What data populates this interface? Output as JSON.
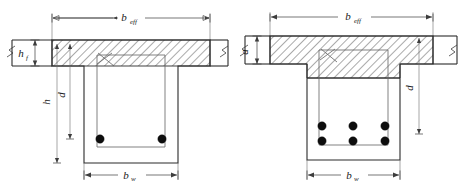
{
  "figure": {
    "background_color": "#ffffff",
    "line_color": "#2b2b2b",
    "rebar_color": "#0d0d0d",
    "hatch_color": "#2b2b2b"
  },
  "diagrams": [
    {
      "id": "left",
      "caption": "T-beam with neutral axis within the flange",
      "hatch_region": "flange",
      "rebar_rows": 1,
      "rebar_per_row": 2,
      "rebar_total": 2,
      "labels": {
        "b_eff": {
          "base": "b",
          "sub": "eff"
        },
        "b_w": {
          "base": "b",
          "sub": "w"
        },
        "h_f": {
          "base": "h",
          "sub": "f"
        },
        "h": {
          "base": "h",
          "sub": ""
        },
        "d": {
          "base": "d",
          "sub": ""
        }
      }
    },
    {
      "id": "right",
      "caption": "T-beam with compression block extending into the web",
      "hatch_region": "flange-and-web-block",
      "rebar_rows": 2,
      "rebar_per_row": 3,
      "rebar_total": 6,
      "labels": {
        "b_eff": {
          "base": "b",
          "sub": "eff"
        },
        "b_w": {
          "base": "b",
          "sub": "w"
        },
        "a": {
          "base": "a",
          "sub": ""
        },
        "d": {
          "base": "d",
          "sub": ""
        }
      }
    }
  ],
  "symbols": {
    "break_symbol": "break-line-zigzag",
    "dimension_arrow": "arrow-tick",
    "rebar_dot": "filled-circle",
    "stirrup_hook": "hook-crossing-lines"
  }
}
